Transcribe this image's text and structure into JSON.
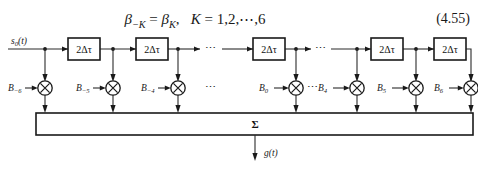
{
  "equation": {
    "text": "β−K = βK,   K = 1,2,⋯,6",
    "beta_lhs": "β",
    "beta_lhs_sub": "−K",
    "equals": "=",
    "beta_rhs": "β",
    "beta_rhs_sub": "K",
    "comma": ",",
    "k_var": "K",
    "k_equals": "= 1,2,⋯,6",
    "number": "(4.55)"
  },
  "diagram": {
    "input_label": "s",
    "input_sub": "0",
    "input_arg": "(t)",
    "output_label": "g",
    "output_arg": "(t)",
    "summation_symbol": "Σ",
    "delay_label": "2Δτ",
    "ellipsis": "⋯",
    "delays": [
      {
        "label": "2Δτ"
      },
      {
        "label": "2Δτ"
      },
      {
        "label": "2Δτ"
      },
      {
        "label": "2Δτ"
      },
      {
        "label": "2Δτ"
      }
    ],
    "coefficients": [
      {
        "base": "B",
        "sub": "−6"
      },
      {
        "base": "B",
        "sub": "−5"
      },
      {
        "base": "B",
        "sub": "−4"
      },
      {
        "base": "B",
        "sub": "0"
      },
      {
        "base": "B",
        "sub": "4"
      },
      {
        "base": "B",
        "sub": "5"
      },
      {
        "base": "B",
        "sub": "6"
      }
    ],
    "multiplier_symbol": "×"
  },
  "colors": {
    "background": "#ffffff",
    "ink": "#1a1a1a",
    "line": "#2b2b2b"
  }
}
